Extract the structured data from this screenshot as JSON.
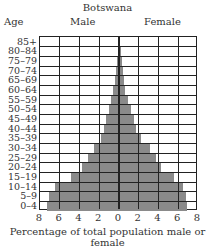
{
  "chart_data": {
    "type": "bar",
    "orientation": "horizontal-population-pyramid",
    "title": "Botswana",
    "ylabel": "Age",
    "xlabel": "Percentage of total population male or female",
    "xlim": [
      -8,
      8
    ],
    "xticks": [
      "8",
      "6",
      "4",
      "2",
      "0",
      "2",
      "4",
      "6",
      "8"
    ],
    "grid": true,
    "categories": [
      "85+",
      "80-84",
      "75-79",
      "70-74",
      "65-69",
      "60-64",
      "55-59",
      "50-54",
      "45-49",
      "40-44",
      "35-39",
      "30-34",
      "25-29",
      "20-24",
      "15-19",
      "10-14",
      "5-9",
      "0-4"
    ],
    "series": [
      {
        "name": "Male",
        "side": "left",
        "values": [
          0.1,
          0.1,
          0.2,
          0.3,
          0.4,
          0.6,
          0.8,
          1.0,
          1.3,
          1.5,
          1.8,
          2.5,
          3.1,
          3.7,
          4.9,
          6.5,
          7.1,
          7.3
        ]
      },
      {
        "name": "Female",
        "side": "right",
        "values": [
          0.1,
          0.2,
          0.3,
          0.4,
          0.5,
          0.6,
          0.9,
          1.2,
          1.5,
          1.7,
          2.2,
          3.1,
          3.7,
          4.3,
          5.6,
          6.5,
          6.8,
          6.9
        ]
      }
    ],
    "bar_color": "#8a8a8a",
    "grid_color": "#222222"
  },
  "labels": {
    "title": "Botswana",
    "age": "Age",
    "male": "Male",
    "female": "Female",
    "xlabel": "Percentage of total population male or female"
  }
}
